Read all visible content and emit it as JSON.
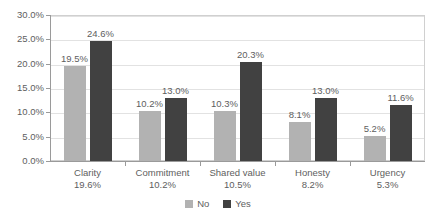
{
  "chart_data": {
    "type": "bar",
    "title": "",
    "subtitle": "",
    "xlabel": "",
    "ylabel": "",
    "grid": true,
    "legend_position": "bottom-center",
    "ylim": [
      0,
      30
    ],
    "ytick_labels": [
      "0.0%",
      "5.0%",
      "10.0%",
      "15.0%",
      "20.0%",
      "25.0%",
      "30.0%"
    ],
    "ytick_values": [
      0,
      5,
      10,
      15,
      20,
      25,
      30
    ],
    "categories": [
      "Clarity",
      "Commitment",
      "Shared value",
      "Honesty",
      "Urgency"
    ],
    "category_sublabels": [
      "19.6%",
      "10.2%",
      "10.5%",
      "8.2%",
      "5.3%"
    ],
    "series": [
      {
        "name": "No",
        "color": "#b2b2b2",
        "values": [
          19.5,
          10.2,
          10.3,
          8.1,
          5.2
        ],
        "labels": [
          "19.5%",
          "10.2%",
          "10.3%",
          "8.1%",
          "5.2%"
        ]
      },
      {
        "name": "Yes",
        "color": "#414141",
        "values": [
          24.6,
          13.0,
          20.3,
          13.0,
          11.6
        ],
        "labels": [
          "24.6%",
          "13.0%",
          "20.3%",
          "13.0%",
          "11.6%"
        ]
      }
    ]
  }
}
